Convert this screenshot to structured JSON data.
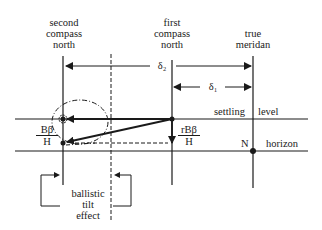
{
  "diagram": {
    "type": "compass ballistic tilt diagram",
    "labels": {
      "second_compass_north": [
        "second",
        "compass",
        "north"
      ],
      "first_compass_north": [
        "first",
        "compass",
        "north"
      ],
      "true_meridian": [
        "true",
        "meridan"
      ],
      "delta2": "δ₂",
      "delta1": "δ₁",
      "settling": "settling",
      "level": "level",
      "horizon": "horizon",
      "N": "N",
      "H_left": "H",
      "H_right": "H",
      "frac_left": {
        "num": "Bβ",
        "den": "H"
      },
      "frac_right": {
        "num": "rBβ",
        "den": "H"
      },
      "ballistic_tilt_effect": [
        "ballistic",
        "tilt",
        "effect"
      ]
    },
    "colors": {
      "ink": "#1a1a1a",
      "background": "#ffffff"
    }
  }
}
